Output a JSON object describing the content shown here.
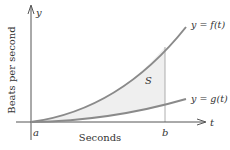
{
  "diagram": {
    "axes": {
      "y_axis_label": "y",
      "x_axis_label": "t",
      "vertical_title": "Beats per second",
      "horizontal_title": "Seconds"
    },
    "points": {
      "a_label": "a",
      "b_label": "b"
    },
    "curves": [
      {
        "name": "f",
        "label": "y = f(t)"
      },
      {
        "name": "g",
        "label": "y = g(t)"
      }
    ],
    "region_label": "S",
    "colors": {
      "curve": "#8a8a8a",
      "axis": "#555555",
      "region_fill": "#efefef",
      "text": "#333333"
    }
  }
}
